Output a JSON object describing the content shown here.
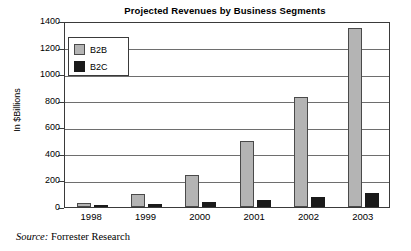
{
  "chart_data": {
    "type": "bar",
    "title": "Projected Revenues by Business Segments",
    "xlabel": "",
    "ylabel": "In $Billions",
    "categories": [
      "1998",
      "1999",
      "2000",
      "2001",
      "2002",
      "2003"
    ],
    "series": [
      {
        "name": "B2B",
        "color": "#b4b4b4",
        "values": [
          33,
          100,
          240,
          500,
          830,
          1350
        ]
      },
      {
        "name": "B2C",
        "color": "#1a1a1a",
        "values": [
          8,
          20,
          40,
          55,
          75,
          108
        ]
      }
    ],
    "ylim": [
      0,
      1400
    ],
    "ytick_values": [
      0,
      200,
      400,
      600,
      800,
      1000,
      1200,
      1400
    ],
    "ytick_labels": [
      "0",
      "200",
      "400",
      "600",
      "800",
      "1000",
      "1200",
      "1400"
    ],
    "grid": true,
    "legend_position": "top-left",
    "legend_entries": [
      "B2B",
      "B2C"
    ]
  },
  "source": {
    "lead": "Source:",
    "text": " Forrester Research"
  }
}
